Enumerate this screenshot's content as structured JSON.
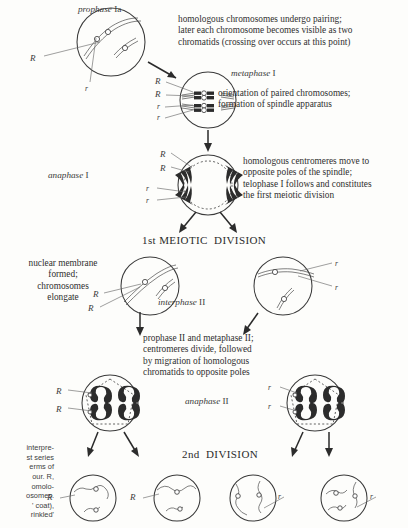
{
  "figure": {
    "type": "meiosis-diagram",
    "background": "#fdfdfb",
    "ink": "#2a2a2a"
  },
  "stages": {
    "prophase1a": {
      "label_italic": "prophase ",
      "label_roman": "Ia",
      "description": "homologous chromosomes undergo pairing;\nlater each chromosome becomes visible as two\nchromatids (crossing over occurs at this point)",
      "alleles": [
        "R",
        "r"
      ]
    },
    "metaphase1": {
      "label_italic": "metaphase ",
      "label_roman": "I",
      "description": "orientation of paired chromosomes;\nformation of spindle apparatus",
      "alleles": [
        "R",
        "R",
        "r",
        "r"
      ]
    },
    "anaphase1": {
      "label_italic": "anaphase ",
      "label_roman": "I",
      "description": "homologous centromeres move to\nopposite poles of the spindle;\ntelophase I follows and constitutes\nthe first meiotic division",
      "alleles": [
        "R",
        "R",
        "r",
        "r"
      ]
    },
    "first_division_title": "1st MEIOTIC  DIVISION",
    "interphase2": {
      "label_italic": "interphase ",
      "label_roman": "II",
      "note": "nuclear membrane\nformed;\nchromosomes\nelongate",
      "alleles_left": [
        "R",
        "R"
      ],
      "alleles_right": [
        "r",
        "r"
      ]
    },
    "prophase_metaphase2": {
      "description": "prophase II and metaphase II;\ncentromeres divide, followed\nby migration of homologous\nchromatids to opposite poles"
    },
    "anaphase2": {
      "label_italic": "anaphase ",
      "label_roman": "II",
      "alleles_left": [
        "R",
        "R"
      ],
      "alleles_right": [
        "r",
        "r"
      ]
    },
    "second_division_title": "2nd  DIVISION",
    "gametes": {
      "alleles": [
        "R",
        "R",
        "r",
        "r"
      ]
    }
  },
  "caption": {
    "lines": [
      "interpre-",
      "st series",
      "erms  of",
      "our.  R,",
      "omolo-",
      "osomes.",
      "' coat),",
      "rinkled'"
    ]
  }
}
